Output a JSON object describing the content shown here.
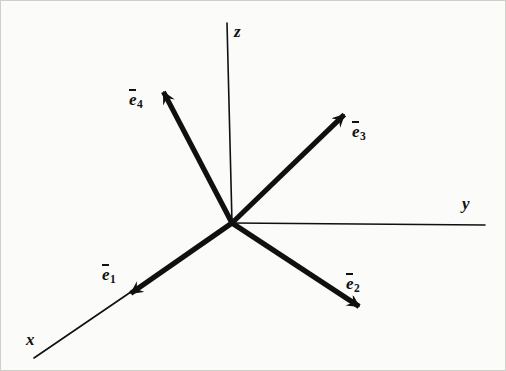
{
  "figure": {
    "type": "vector-diagram",
    "background_color": "#fbfbf9",
    "stroke_color": "#101010",
    "border_color": "#cfcfcb",
    "origin": {
      "x": 231,
      "y": 222
    },
    "axes": [
      {
        "id": "z",
        "label": "z",
        "label_x": 233,
        "label_y": 21,
        "from": {
          "x": 226,
          "y": 22
        },
        "to": {
          "x": 231,
          "y": 222
        },
        "stroke_width": 1.6,
        "arrow": false
      },
      {
        "id": "y",
        "label": "y",
        "label_x": 461,
        "label_y": 193,
        "from": {
          "x": 231,
          "y": 222
        },
        "to": {
          "x": 484,
          "y": 224
        },
        "stroke_width": 1.6,
        "arrow": false
      },
      {
        "id": "x",
        "label": "x",
        "label_x": 25,
        "label_y": 329,
        "from": {
          "x": 231,
          "y": 222
        },
        "to": {
          "x": 33,
          "y": 357
        },
        "stroke_width": 1.6,
        "arrow": false
      }
    ],
    "vectors": [
      {
        "id": "e1",
        "base_label": "e",
        "subscript": "1",
        "label_x": 101,
        "label_y": 263,
        "from": {
          "x": 231,
          "y": 222
        },
        "to": {
          "x": 129,
          "y": 293
        },
        "stroke_width": 5.2,
        "arrow": true
      },
      {
        "id": "e2",
        "base_label": "e",
        "subscript": "2",
        "label_x": 345,
        "label_y": 272,
        "from": {
          "x": 231,
          "y": 222
        },
        "to": {
          "x": 359,
          "y": 306
        },
        "stroke_width": 5.2,
        "arrow": true
      },
      {
        "id": "e3",
        "base_label": "e",
        "subscript": "3",
        "label_x": 351,
        "label_y": 120,
        "from": {
          "x": 231,
          "y": 222
        },
        "to": {
          "x": 344,
          "y": 113
        },
        "stroke_width": 5.2,
        "arrow": true
      },
      {
        "id": "e4",
        "base_label": "e",
        "subscript": "4",
        "label_x": 128,
        "label_y": 88,
        "from": {
          "x": 231,
          "y": 222
        },
        "to": {
          "x": 162,
          "y": 90
        },
        "stroke_width": 5.2,
        "arrow": true
      }
    ]
  }
}
